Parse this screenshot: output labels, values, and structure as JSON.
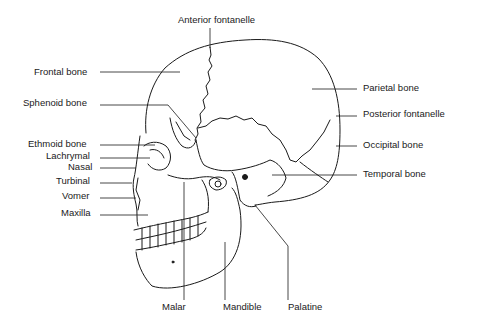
{
  "diagram": {
    "labels": {
      "top": [
        "Anterior fontanelle"
      ],
      "left": [
        "Frontal bone",
        "Sphenoid bone",
        "Ethmoid bone",
        "Lachrymal",
        "Nasal",
        "Turbinal",
        "Vomer",
        "Maxilla"
      ],
      "right": [
        "Parietal bone",
        "Posterior fontanelle",
        "Occipital bone",
        "Temporal bone"
      ],
      "bottom": [
        "Malar",
        "Mandible",
        "Palatine"
      ]
    }
  }
}
